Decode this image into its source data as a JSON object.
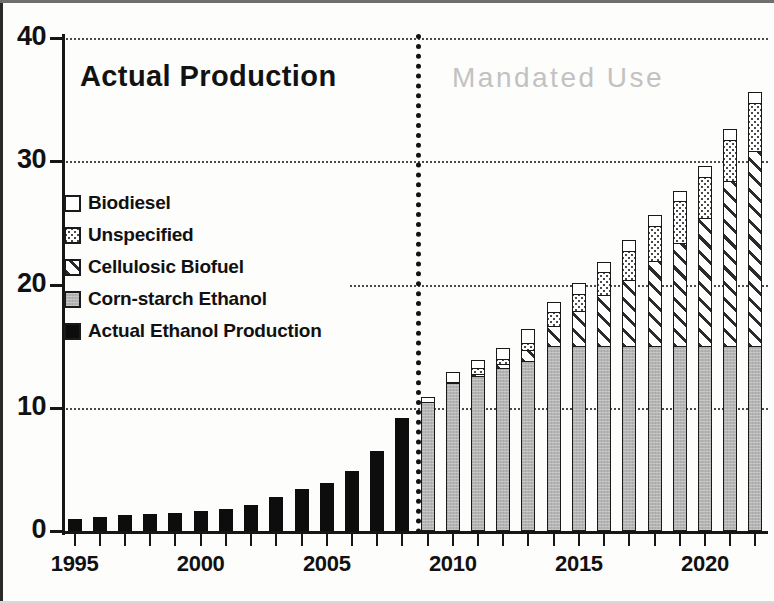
{
  "figure": {
    "caption_actual": "Actual Production",
    "caption_mandated": "Mandated  Use"
  },
  "legend": {
    "items": [
      {
        "label": "Biodiesel",
        "pattern": "white",
        "color": "#ffffff"
      },
      {
        "label": "Unspecified",
        "pattern": "dots",
        "color": "#cfcfcf"
      },
      {
        "label": "Cellulosic Biofuel",
        "pattern": "hatch",
        "color": "#ffffff"
      },
      {
        "label": "Corn-starch Ethanol",
        "pattern": "gray",
        "color": "#b4b4b4"
      },
      {
        "label": "Actual Ethanol Production",
        "pattern": "black",
        "color": "#0d0d0d"
      }
    ]
  },
  "axes": {
    "y_ticks": [
      "0",
      "10",
      "20",
      "30",
      "40"
    ],
    "x_labels": [
      "1995",
      "2000",
      "2005",
      "2010",
      "2015",
      "2020"
    ]
  },
  "chart_data": {
    "type": "bar",
    "title": "",
    "subtitle": "",
    "xlabel": "",
    "ylabel": "",
    "ylim": [
      0,
      40
    ],
    "xlim": [
      1994.5,
      2022.5
    ],
    "grid": true,
    "grid_values": [
      10,
      20,
      30,
      40
    ],
    "legend_position": "inside-left",
    "stacked": true,
    "annotations": [
      {
        "text": "Actual Production",
        "x": 2000,
        "y": 37,
        "color": "#121212"
      },
      {
        "text": "Mandated  Use",
        "x": 2015,
        "y": 37,
        "color": "#c2c2c2"
      },
      {
        "text": "divider",
        "x": 2008.5,
        "kind": "vertical-dotted-line"
      }
    ],
    "categories": [
      "1995",
      "1996",
      "1997",
      "1998",
      "1999",
      "2000",
      "2001",
      "2002",
      "2003",
      "2004",
      "2005",
      "2006",
      "2007",
      "2008",
      "2009",
      "2010",
      "2011",
      "2012",
      "2013",
      "2014",
      "2015",
      "2016",
      "2017",
      "2018",
      "2019",
      "2020",
      "2021",
      "2022"
    ],
    "series": [
      {
        "name": "Actual Ethanol Production",
        "pattern": "black",
        "values": [
          1.0,
          1.1,
          1.3,
          1.4,
          1.5,
          1.6,
          1.8,
          2.1,
          2.8,
          3.4,
          3.9,
          4.9,
          6.5,
          9.2,
          null,
          null,
          null,
          null,
          null,
          null,
          null,
          null,
          null,
          null,
          null,
          null,
          null,
          null
        ]
      },
      {
        "name": "Corn-starch Ethanol",
        "pattern": "gray",
        "values": [
          null,
          null,
          null,
          null,
          null,
          null,
          null,
          null,
          null,
          null,
          null,
          null,
          null,
          null,
          10.5,
          12.0,
          12.6,
          13.2,
          13.8,
          15.0,
          15.0,
          15.0,
          15.0,
          15.0,
          15.0,
          15.0,
          15.0,
          15.0
        ]
      },
      {
        "name": "Cellulosic Biofuel",
        "pattern": "hatch",
        "values": [
          null,
          null,
          null,
          null,
          null,
          null,
          null,
          null,
          null,
          null,
          null,
          null,
          null,
          null,
          0.0,
          0.1,
          0.25,
          0.5,
          1.0,
          1.75,
          3.0,
          4.25,
          5.5,
          7.0,
          8.5,
          10.5,
          13.5,
          16.0
        ]
      },
      {
        "name": "Unspecified",
        "pattern": "dots",
        "values": [
          null,
          null,
          null,
          null,
          null,
          null,
          null,
          null,
          null,
          null,
          null,
          null,
          null,
          null,
          0.0,
          0.2,
          0.6,
          0.5,
          0.7,
          1.25,
          1.5,
          2.0,
          2.5,
          3.0,
          3.5,
          3.5,
          3.5,
          4.0
        ]
      },
      {
        "name": "Biodiesel",
        "pattern": "white",
        "values": [
          null,
          null,
          null,
          null,
          null,
          null,
          null,
          null,
          null,
          null,
          null,
          null,
          null,
          null,
          0.5,
          0.95,
          0.8,
          1.0,
          1.3,
          1.0,
          1.0,
          1.0,
          1.0,
          1.0,
          1.0,
          1.0,
          1.0,
          1.0
        ]
      }
    ],
    "totals": [
      1.0,
      1.1,
      1.3,
      1.4,
      1.5,
      1.6,
      1.8,
      2.1,
      2.8,
      3.4,
      3.9,
      4.9,
      6.5,
      9.2,
      11.0,
      13.25,
      14.25,
      15.2,
      16.8,
      19.0,
      20.5,
      22.25,
      24.0,
      26.0,
      28.0,
      30.0,
      33.0,
      36.0
    ]
  }
}
